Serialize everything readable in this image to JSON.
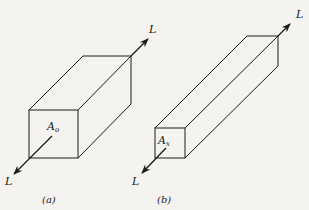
{
  "figure": {
    "panels": [
      {
        "id": "a",
        "caption": "(a)",
        "area_label": "A",
        "area_subscript": "o",
        "load_label_top": "L",
        "load_label_bottom": "L",
        "description": "Short, wide rectangular prism under axial load L"
      },
      {
        "id": "b",
        "caption": "(b)",
        "area_label": "A",
        "area_subscript": "x",
        "load_label_top": "L",
        "load_label_bottom": "L",
        "description": "Long, slender rectangular prism under axial load L"
      }
    ],
    "colors": {
      "background": "#f4f3ef",
      "stroke": "#1a1a1a"
    }
  }
}
